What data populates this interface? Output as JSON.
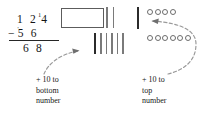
{
  "problem": {
    "minuend_tens": "1 2",
    "minuend_regroup": "1",
    "minuend_ones": "4",
    "minus_sign": "−",
    "subtrahend_tick": "'",
    "subtrahend": "5 6",
    "difference": "6 8"
  },
  "blocks": {
    "hundreds_block_label": "hundreds-block",
    "tens_top_count": 2,
    "tens_bottom_count": 6,
    "tens_bottom_new_index": 0,
    "ones_single_tally_label": "added-ten-tally",
    "ones_top_count": 4,
    "ones_bottom_count": 6
  },
  "captions": {
    "left": {
      "line1": "+ 10 to",
      "line2": "bottom",
      "line3": "number"
    },
    "right": {
      "line1": "+ 10 to",
      "line2": "top",
      "line3": "number"
    }
  },
  "colors": {
    "background": "#ffffff",
    "text": "#171717",
    "block_outline": "#5c5c5c",
    "tally_light": "#7a7a7a",
    "tally_dark": "#2b2b2b",
    "dot_outline": "#6d6d6d",
    "arrow": "#8a8a8a"
  }
}
